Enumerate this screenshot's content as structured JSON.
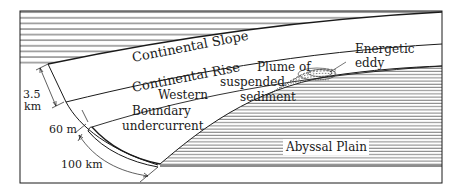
{
  "diagram": {
    "labels": {
      "continental_slope": "Continental Slope",
      "continental_rise": "Continental Rise",
      "western": "Western",
      "boundary": "Boundary",
      "undercurrent": "undercurrent",
      "plume_line1": "Plume of",
      "plume_line2": "suspended",
      "plume_line3": "sediment",
      "eddy_line1": "Energetic",
      "eddy_line2": "eddy",
      "abyssal_plain": "Abyssal Plain"
    },
    "dimensions": {
      "depth_value": "3.5",
      "depth_unit": "km",
      "thickness": "60 m",
      "width": "100 km"
    },
    "colors": {
      "ink": "#1a1a1a",
      "background": "#ffffff"
    }
  }
}
